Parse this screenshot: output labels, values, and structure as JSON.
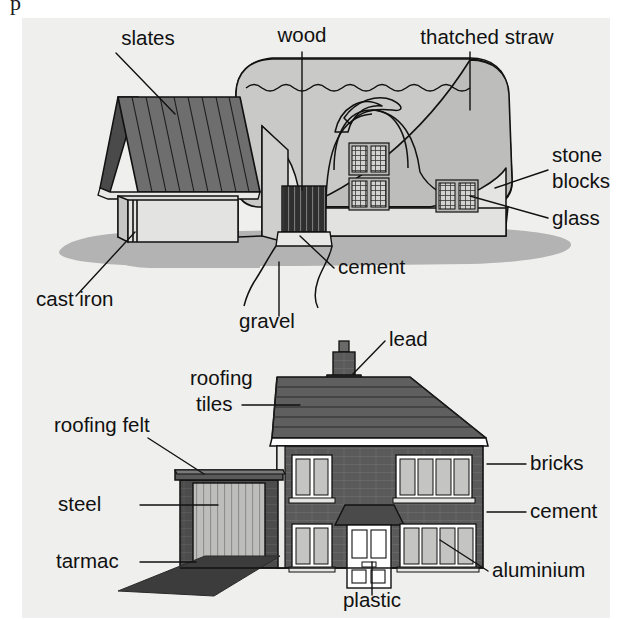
{
  "figure": {
    "title_fragment": "p",
    "background_color": "#ffffff",
    "panels": [
      {
        "id": "cottage",
        "name": "traditional-cottage",
        "panel_background": "#efefed",
        "labels": [
          {
            "id": "slates",
            "text": "slates",
            "anchor": "middle",
            "x": 148,
            "y": 45
          },
          {
            "id": "wood",
            "text": "wood",
            "anchor": "middle",
            "x": 302,
            "y": 42
          },
          {
            "id": "thatched-straw",
            "text": "thatched straw",
            "anchor": "middle",
            "x": 487,
            "y": 44
          },
          {
            "id": "stone-blocks-1",
            "text": "stone",
            "anchor": "start",
            "x": 552,
            "y": 162
          },
          {
            "id": "stone-blocks-2",
            "text": "blocks",
            "anchor": "start",
            "x": 552,
            "y": 188
          },
          {
            "id": "glass",
            "text": "glass",
            "anchor": "start",
            "x": 552,
            "y": 225
          },
          {
            "id": "cement",
            "text": "cement",
            "anchor": "start",
            "x": 338,
            "y": 274
          },
          {
            "id": "cast-iron",
            "text": "cast iron",
            "anchor": "start",
            "x": 36,
            "y": 306
          },
          {
            "id": "gravel",
            "text": "gravel",
            "anchor": "middle",
            "x": 267,
            "y": 328
          }
        ],
        "materials": [
          "slates",
          "wood",
          "thatched straw",
          "stone blocks",
          "glass",
          "cement",
          "cast iron",
          "gravel"
        ]
      },
      {
        "id": "modern-house",
        "name": "modern-house",
        "panel_background": "#efefed",
        "labels": [
          {
            "id": "lead",
            "text": "lead",
            "anchor": "start",
            "x": 389,
            "y": 346
          },
          {
            "id": "roofing-tiles-1",
            "text": "roofing",
            "anchor": "start",
            "x": 190,
            "y": 385
          },
          {
            "id": "roofing-tiles-2",
            "text": "tiles",
            "anchor": "start",
            "x": 196,
            "y": 411
          },
          {
            "id": "roofing-felt",
            "text": "roofing felt",
            "anchor": "start",
            "x": 54,
            "y": 432
          },
          {
            "id": "bricks",
            "text": "bricks",
            "anchor": "start",
            "x": 530,
            "y": 470
          },
          {
            "id": "steel",
            "text": "steel",
            "anchor": "start",
            "x": 58,
            "y": 511
          },
          {
            "id": "cement-2",
            "text": "cement",
            "anchor": "start",
            "x": 530,
            "y": 518
          },
          {
            "id": "tarmac",
            "text": "tarmac",
            "anchor": "start",
            "x": 56,
            "y": 568
          },
          {
            "id": "aluminium",
            "text": "aluminium",
            "anchor": "start",
            "x": 492,
            "y": 577
          },
          {
            "id": "plastic",
            "text": "plastic",
            "anchor": "middle",
            "x": 372,
            "y": 607
          }
        ],
        "materials": [
          "lead",
          "roofing tiles",
          "roofing felt",
          "bricks",
          "steel",
          "cement",
          "tarmac",
          "aluminium",
          "plastic"
        ]
      }
    ],
    "colors": {
      "panel_bg": "#efefed",
      "ground_shadow": "#b3b3b3",
      "cottage_wall_light": "#e4e4e2",
      "cottage_wall_mid": "#d2d2d0",
      "thatch": "#c9c9c7",
      "slate_roof": "#6e6e6e",
      "slate_roof_dark": "#4a4a4a",
      "door_dark": "#3a3a3a",
      "brick_wall": "#5a5a5a",
      "brick_wall_dark": "#4a4a4a",
      "roof_tile": "#5f5f5f",
      "roof_tile_dark": "#474747",
      "window_glass": "#c4c4c2",
      "white_trim": "#ffffff",
      "garage_door": "#b9b9b7",
      "tarmac": "#3c3c3c",
      "outline": "#111111",
      "text": "#111111"
    }
  }
}
